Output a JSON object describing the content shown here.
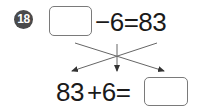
{
  "problem": {
    "number": "18",
    "top_equation": {
      "blank": "",
      "operator_and_operand": "−6",
      "equals": "=",
      "result": "83",
      "text": "−6=83"
    },
    "bottom_equation": {
      "start_value": "83",
      "operator_and_operand": "+6",
      "equals": "=",
      "blank": "",
      "text": "+6="
    },
    "arrows": {
      "count": 3,
      "description": "two crossing diagonal arrows and one vertical arrow pointing down from the top equation to the bottom equation"
    }
  },
  "colors": {
    "badge": "#4a4a4a",
    "box_border": "#7a7a7a",
    "text": "#1a1a1a",
    "arrow": "#555555"
  }
}
